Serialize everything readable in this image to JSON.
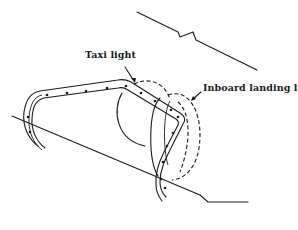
{
  "diagram": {
    "type": "technical-line-drawing",
    "labels": {
      "taxi_light": "Taxi light",
      "inboard_landing_light": "Inboard landing light"
    },
    "colors": {
      "ink": "#1a1a1a",
      "background": "#ffffff"
    }
  }
}
